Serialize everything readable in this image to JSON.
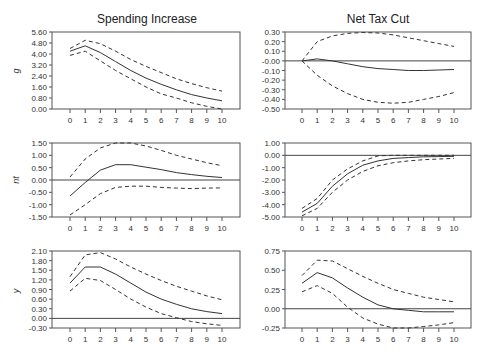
{
  "columns": [
    "Spending Increase",
    "Net Tax Cut"
  ],
  "rows": [
    "g",
    "nt",
    "y"
  ],
  "chart_data": [
    {
      "type": "line",
      "title": "Spending Increase",
      "ylabel": "g",
      "x": [
        0,
        1,
        2,
        3,
        4,
        5,
        6,
        7,
        8,
        9,
        10
      ],
      "yticks": [
        "0.00",
        "0.80",
        "1.60",
        "2.40",
        "3.20",
        "4.00",
        "4.80",
        "5.60"
      ],
      "ylim": [
        0,
        5.6
      ],
      "zero_line": false,
      "series": [
        {
          "name": "response",
          "style": "solid",
          "values": [
            4.2,
            4.6,
            4.1,
            3.45,
            2.8,
            2.25,
            1.8,
            1.4,
            1.05,
            0.8,
            0.6
          ]
        },
        {
          "name": "upper band",
          "style": "dashed",
          "values": [
            4.4,
            5.0,
            4.75,
            4.2,
            3.6,
            3.1,
            2.65,
            2.2,
            1.85,
            1.55,
            1.3
          ]
        },
        {
          "name": "lower band",
          "style": "dashed",
          "values": [
            3.9,
            4.2,
            3.5,
            2.8,
            2.2,
            1.6,
            1.1,
            0.8,
            0.45,
            0.2,
            0.0
          ]
        }
      ]
    },
    {
      "type": "line",
      "title": "Net Tax Cut",
      "ylabel": "",
      "x": [
        0,
        1,
        2,
        3,
        4,
        5,
        6,
        7,
        8,
        9,
        10
      ],
      "yticks": [
        "-0.50",
        "-0.40",
        "-0.30",
        "-0.20",
        "-0.10",
        "-0.00",
        "0.10",
        "0.20",
        "0.30"
      ],
      "ylim": [
        -0.5,
        0.3
      ],
      "zero_line": true,
      "series": [
        {
          "name": "response",
          "style": "solid",
          "values": [
            0.0,
            0.02,
            0.0,
            -0.03,
            -0.06,
            -0.08,
            -0.09,
            -0.1,
            -0.1,
            -0.095,
            -0.09
          ]
        },
        {
          "name": "upper band",
          "style": "dashed",
          "values": [
            0.0,
            0.2,
            0.26,
            0.285,
            0.295,
            0.29,
            0.27,
            0.24,
            0.21,
            0.18,
            0.15
          ]
        },
        {
          "name": "lower band",
          "style": "dashed",
          "values": [
            0.0,
            -0.15,
            -0.26,
            -0.34,
            -0.4,
            -0.43,
            -0.44,
            -0.43,
            -0.4,
            -0.37,
            -0.33
          ]
        }
      ]
    },
    {
      "type": "line",
      "title": "",
      "ylabel": "nt",
      "x": [
        0,
        1,
        2,
        3,
        4,
        5,
        6,
        7,
        8,
        9,
        10
      ],
      "yticks": [
        "-1.50",
        "-1.00",
        "-0.50",
        "0.00",
        "0.50",
        "1.00",
        "1.50"
      ],
      "ylim": [
        -1.5,
        1.5
      ],
      "zero_line": true,
      "series": [
        {
          "name": "response",
          "style": "solid",
          "values": [
            -0.65,
            -0.1,
            0.4,
            0.62,
            0.62,
            0.52,
            0.42,
            0.3,
            0.22,
            0.15,
            0.1
          ]
        },
        {
          "name": "upper band",
          "style": "dashed",
          "values": [
            0.12,
            0.85,
            1.3,
            1.5,
            1.5,
            1.38,
            1.2,
            1.0,
            0.85,
            0.7,
            0.58
          ]
        },
        {
          "name": "lower band",
          "style": "dashed",
          "values": [
            -1.42,
            -1.0,
            -0.55,
            -0.3,
            -0.25,
            -0.25,
            -0.3,
            -0.33,
            -0.35,
            -0.33,
            -0.32
          ]
        }
      ]
    },
    {
      "type": "line",
      "title": "",
      "ylabel": "",
      "x": [
        0,
        1,
        2,
        3,
        4,
        5,
        6,
        7,
        8,
        9,
        10
      ],
      "yticks": [
        "-5.00",
        "-4.00",
        "-3.00",
        "-2.00",
        "-1.00",
        "0.00",
        "1.00"
      ],
      "ylim": [
        -5.0,
        1.0
      ],
      "zero_line": true,
      "series": [
        {
          "name": "response",
          "style": "solid",
          "values": [
            -4.6,
            -3.9,
            -2.5,
            -1.5,
            -0.8,
            -0.45,
            -0.25,
            -0.18,
            -0.12,
            -0.1,
            -0.08
          ]
        },
        {
          "name": "upper band",
          "style": "dashed",
          "values": [
            -4.3,
            -3.5,
            -2.0,
            -1.1,
            -0.45,
            -0.05,
            0.0,
            0.0,
            0.0,
            0.0,
            0.0
          ]
        },
        {
          "name": "lower band",
          "style": "dashed",
          "values": [
            -4.9,
            -4.3,
            -3.0,
            -2.0,
            -1.3,
            -0.85,
            -0.6,
            -0.45,
            -0.35,
            -0.3,
            -0.25
          ]
        }
      ]
    },
    {
      "type": "line",
      "title": "",
      "ylabel": "y",
      "x": [
        0,
        1,
        2,
        3,
        4,
        5,
        6,
        7,
        8,
        9,
        10
      ],
      "yticks": [
        "-0.30",
        "0.00",
        "0.30",
        "0.60",
        "0.90",
        "1.20",
        "1.50",
        "1.80",
        "2.10"
      ],
      "ylim": [
        -0.3,
        2.1
      ],
      "zero_line": true,
      "series": [
        {
          "name": "response",
          "style": "solid",
          "values": [
            1.1,
            1.6,
            1.6,
            1.38,
            1.1,
            0.82,
            0.6,
            0.44,
            0.3,
            0.21,
            0.15
          ]
        },
        {
          "name": "upper band",
          "style": "dashed",
          "values": [
            1.3,
            1.98,
            2.05,
            1.85,
            1.6,
            1.38,
            1.18,
            1.0,
            0.85,
            0.7,
            0.58
          ]
        },
        {
          "name": "lower band",
          "style": "dashed",
          "values": [
            0.85,
            1.25,
            1.18,
            0.9,
            0.6,
            0.35,
            0.15,
            0.02,
            -0.1,
            -0.17,
            -0.22
          ]
        }
      ]
    },
    {
      "type": "line",
      "title": "",
      "ylabel": "",
      "x": [
        0,
        1,
        2,
        3,
        4,
        5,
        6,
        7,
        8,
        9,
        10
      ],
      "yticks": [
        "-0.25",
        "0.00",
        "0.25",
        "0.50",
        "0.75"
      ],
      "ylim": [
        -0.25,
        0.75
      ],
      "zero_line": true,
      "series": [
        {
          "name": "response",
          "style": "solid",
          "values": [
            0.33,
            0.47,
            0.4,
            0.27,
            0.15,
            0.05,
            0.0,
            -0.02,
            -0.04,
            -0.04,
            -0.04
          ]
        },
        {
          "name": "upper band",
          "style": "dashed",
          "values": [
            0.43,
            0.63,
            0.62,
            0.52,
            0.42,
            0.33,
            0.25,
            0.2,
            0.15,
            0.12,
            0.09
          ]
        },
        {
          "name": "lower band",
          "style": "dashed",
          "values": [
            0.22,
            0.3,
            0.2,
            0.02,
            -0.12,
            -0.2,
            -0.25,
            -0.25,
            -0.23,
            -0.21,
            -0.18
          ]
        }
      ]
    }
  ]
}
